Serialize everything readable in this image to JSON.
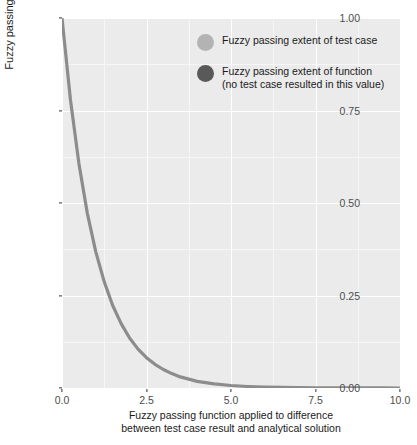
{
  "chart_data": {
    "type": "line",
    "title": "",
    "xlabel": "Fuzzy passing function applied to difference between test case result and analytical solution",
    "xlabel_lines": [
      "Fuzzy passing function applied to difference",
      "between test case result and analytical solution"
    ],
    "ylabel": "Fuzzy passing extent",
    "xlim": [
      0.0,
      10.0
    ],
    "ylim": [
      0.0,
      1.0
    ],
    "xticks": [
      "0.0",
      "2.5",
      "5.0",
      "7.5",
      "10.0"
    ],
    "xtick_values": [
      0.0,
      2.5,
      5.0,
      7.5,
      10.0
    ],
    "yticks": [
      "0.00",
      "0.25",
      "0.50",
      "0.75",
      "1.00"
    ],
    "ytick_values": [
      0.0,
      0.25,
      0.5,
      0.75,
      1.0
    ],
    "grid": true,
    "grid_major_color": "#ffffff",
    "grid_minor_color": "#f6f6f6",
    "panel_background": "#ebebeb",
    "legend_position": "top-right",
    "series": [
      {
        "name": "Fuzzy passing extent of function",
        "color": "#8c8c8c",
        "x": [
          0.0,
          0.25,
          0.5,
          0.75,
          1.0,
          1.25,
          1.5,
          1.75,
          2.0,
          2.25,
          2.5,
          2.75,
          3.0,
          3.25,
          3.5,
          3.75,
          4.0,
          4.5,
          5.0,
          5.5,
          6.0,
          6.5,
          7.0,
          7.5,
          8.0,
          8.5,
          9.0,
          9.5,
          10.0
        ],
        "y": [
          1.0,
          0.779,
          0.607,
          0.472,
          0.368,
          0.287,
          0.223,
          0.174,
          0.135,
          0.105,
          0.082,
          0.064,
          0.05,
          0.039,
          0.03,
          0.024,
          0.018,
          0.011,
          0.0067,
          0.0041,
          0.0025,
          0.0015,
          0.0009,
          0.00055,
          0.00034,
          0.0002,
          0.00012,
          7e-05,
          5e-05
        ]
      }
    ],
    "annotation": "Exponential decay curve: y = exp(-x)"
  },
  "legend": {
    "items": [
      {
        "marker": "circle-marker",
        "color": "#b3b3b3",
        "lines": [
          "Fuzzy passing extent of test case"
        ]
      },
      {
        "marker": "circle-marker",
        "color": "#595959",
        "lines": [
          "Fuzzy passing extent of function",
          "(no test case resulted in this value)"
        ]
      }
    ]
  },
  "colors": {
    "curve": "#8c8c8c",
    "panel": "#ebebeb",
    "grid_major": "#ffffff",
    "grid_minor": "#f6f6f6",
    "axis_text": "#4d4d4d",
    "axis_title": "#1a1a1a"
  }
}
